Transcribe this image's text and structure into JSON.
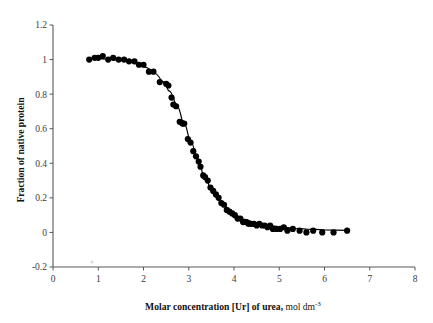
{
  "chart_data": {
    "type": "scatter",
    "title": "",
    "xlabel": "Molar concentration [Ur] of urea, mol dm",
    "xlabel_sup": "-3",
    "ylabel": "Fraction of native protein",
    "xlim": [
      0,
      8
    ],
    "ylim": [
      -0.2,
      1.2
    ],
    "xticks": [
      0,
      1,
      2,
      3,
      4,
      5,
      6,
      7,
      8
    ],
    "yticks": [
      -0.2,
      0,
      0.2,
      0.4,
      0.6,
      0.8,
      1,
      1.2
    ],
    "xticklabels": [
      "0",
      "1",
      "2",
      "3",
      "4",
      "5",
      "6",
      "7",
      "8"
    ],
    "yticklabels": [
      "-0.2",
      "0",
      "0.2",
      "0.4",
      "0.6",
      "0.8",
      "1",
      "1.2"
    ],
    "grid": false,
    "legend": false,
    "marker": "filled-circle",
    "marker_color": "#000000",
    "marker_size": 5,
    "curve_color": "#000000",
    "series": [
      {
        "name": "Fraction of native protein vs urea",
        "points": [
          [
            0.8,
            1.0
          ],
          [
            0.92,
            1.01
          ],
          [
            1.0,
            1.01
          ],
          [
            1.1,
            1.02
          ],
          [
            1.22,
            1.0
          ],
          [
            1.33,
            1.01
          ],
          [
            1.45,
            1.0
          ],
          [
            1.57,
            1.0
          ],
          [
            1.68,
            0.99
          ],
          [
            1.8,
            0.99
          ],
          [
            1.9,
            0.97
          ],
          [
            2.0,
            0.97
          ],
          [
            2.12,
            0.93
          ],
          [
            2.22,
            0.93
          ],
          [
            2.36,
            0.87
          ],
          [
            2.5,
            0.86
          ],
          [
            2.55,
            0.85
          ],
          [
            2.62,
            0.78
          ],
          [
            2.66,
            0.74
          ],
          [
            2.72,
            0.73
          ],
          [
            2.8,
            0.64
          ],
          [
            2.86,
            0.63
          ],
          [
            2.9,
            0.63
          ],
          [
            2.98,
            0.54
          ],
          [
            3.04,
            0.52
          ],
          [
            3.1,
            0.47
          ],
          [
            3.16,
            0.44
          ],
          [
            3.22,
            0.41
          ],
          [
            3.26,
            0.38
          ],
          [
            3.32,
            0.33
          ],
          [
            3.36,
            0.32
          ],
          [
            3.42,
            0.3
          ],
          [
            3.48,
            0.26
          ],
          [
            3.54,
            0.24
          ],
          [
            3.6,
            0.22
          ],
          [
            3.66,
            0.2
          ],
          [
            3.72,
            0.17
          ],
          [
            3.78,
            0.16
          ],
          [
            3.84,
            0.13
          ],
          [
            3.9,
            0.12
          ],
          [
            3.96,
            0.11
          ],
          [
            4.02,
            0.1
          ],
          [
            4.08,
            0.08
          ],
          [
            4.14,
            0.08
          ],
          [
            4.2,
            0.06
          ],
          [
            4.26,
            0.06
          ],
          [
            4.32,
            0.05
          ],
          [
            4.38,
            0.05
          ],
          [
            4.44,
            0.05
          ],
          [
            4.5,
            0.04
          ],
          [
            4.56,
            0.05
          ],
          [
            4.62,
            0.04
          ],
          [
            4.68,
            0.04
          ],
          [
            4.74,
            0.03
          ],
          [
            4.8,
            0.04
          ],
          [
            4.86,
            0.02
          ],
          [
            4.94,
            0.02
          ],
          [
            5.02,
            0.02
          ],
          [
            5.1,
            0.03
          ],
          [
            5.18,
            0.01
          ],
          [
            5.3,
            0.02
          ],
          [
            5.45,
            0.01
          ],
          [
            5.6,
            0.0
          ],
          [
            5.75,
            0.01
          ],
          [
            5.95,
            0.0
          ],
          [
            6.2,
            0.0
          ],
          [
            6.5,
            0.01
          ]
        ]
      }
    ],
    "fit": {
      "name": "sigmoidal transition fit",
      "midpoint": 3.0,
      "points": [
        [
          0.8,
          1.005
        ],
        [
          1.0,
          1.005
        ],
        [
          1.2,
          1.002
        ],
        [
          1.4,
          0.997
        ],
        [
          1.6,
          0.99
        ],
        [
          1.8,
          0.978
        ],
        [
          2.0,
          0.958
        ],
        [
          2.2,
          0.925
        ],
        [
          2.4,
          0.875
        ],
        [
          2.55,
          0.82
        ],
        [
          2.7,
          0.745
        ],
        [
          2.85,
          0.65
        ],
        [
          3.0,
          0.545
        ],
        [
          3.15,
          0.44
        ],
        [
          3.3,
          0.345
        ],
        [
          3.45,
          0.268
        ],
        [
          3.6,
          0.205
        ],
        [
          3.75,
          0.158
        ],
        [
          3.9,
          0.122
        ],
        [
          4.05,
          0.096
        ],
        [
          4.2,
          0.077
        ],
        [
          4.4,
          0.06
        ],
        [
          4.6,
          0.047
        ],
        [
          4.8,
          0.038
        ],
        [
          5.0,
          0.031
        ],
        [
          5.3,
          0.024
        ],
        [
          5.6,
          0.019
        ],
        [
          6.0,
          0.015
        ],
        [
          6.5,
          0.012
        ]
      ]
    }
  }
}
